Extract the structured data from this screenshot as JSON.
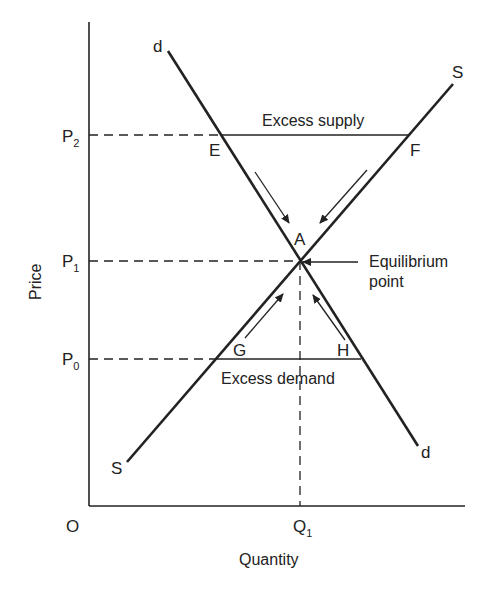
{
  "diagram": {
    "axes": {
      "x_label": "Quantity",
      "y_label": "Price",
      "origin_label": "O"
    },
    "price_levels": [
      {
        "id": "P2",
        "main": "P",
        "sub": "2"
      },
      {
        "id": "P1",
        "main": "P",
        "sub": "1"
      },
      {
        "id": "P0",
        "main": "P",
        "sub": "0"
      }
    ],
    "quantity_levels": [
      {
        "id": "Q1",
        "main": "Q",
        "sub": "1"
      }
    ],
    "curves": {
      "demand": {
        "label_top": "d",
        "label_bottom": "d"
      },
      "supply": {
        "label_top": "S",
        "label_bottom": "S"
      }
    },
    "points": {
      "E": "E",
      "F": "F",
      "A": "A",
      "G": "G",
      "H": "H"
    },
    "annotations": {
      "excess_supply": "Excess supply",
      "excess_demand": "Excess demand",
      "equilibrium_line1": "Equilibrium",
      "equilibrium_line2": "point"
    },
    "colors": {
      "ink": "#222222",
      "background": "#ffffff"
    }
  }
}
